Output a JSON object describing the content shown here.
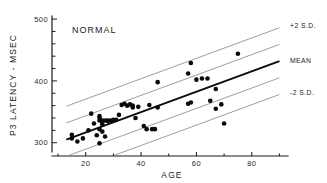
{
  "figure": {
    "panel_label": "NORMAL"
  },
  "axes": {
    "y_title": "P3 LATENCY - MSEC",
    "x_title": "AGE",
    "y_ticks_labeled": [
      "500",
      "400",
      "300"
    ],
    "y_tick_values": [
      500,
      400,
      300
    ],
    "y_minor_tick_values": [
      480,
      460,
      440,
      420,
      380,
      360,
      340,
      320
    ],
    "x_ticks_labeled": [
      "20",
      "40",
      "60",
      "80"
    ],
    "x_tick_values": [
      20,
      40,
      60,
      80
    ],
    "x_minor_tick_values": [
      10,
      30,
      50,
      70,
      90
    ]
  },
  "band_labels": {
    "upper": "+2 S.D.",
    "mean": "MEAN",
    "lower": "-2 S.D."
  },
  "colors": {
    "axis": "#1a1a1a",
    "point": "#0a0a0a",
    "mean_line": "#0d0d0d",
    "band_line": "#8c8c8c",
    "background": "#ffffff"
  },
  "chart_data": {
    "type": "scatter",
    "title": "NORMAL",
    "xlabel": "AGE",
    "ylabel": "P3 LATENCY - MSEC",
    "xlim": [
      10,
      92
    ],
    "ylim": [
      285,
      505
    ],
    "grid": false,
    "legend_position": "right-outside",
    "x": [
      15,
      15,
      17,
      19,
      21,
      22,
      23,
      24,
      25,
      25,
      25,
      25,
      25,
      26,
      26,
      26,
      26,
      27,
      27,
      28,
      28,
      29,
      30,
      31,
      32,
      33,
      34,
      35,
      36,
      37,
      37,
      38,
      39,
      41,
      42,
      43,
      44,
      45,
      46,
      46,
      57,
      57,
      58,
      58,
      60,
      62,
      64,
      65,
      67,
      67,
      69,
      70,
      75
    ],
    "y": [
      313,
      307,
      302,
      307,
      320,
      347,
      331,
      312,
      343,
      340,
      336,
      322,
      299,
      336,
      334,
      330,
      318,
      336,
      310,
      336,
      335,
      336,
      337,
      337,
      345,
      361,
      363,
      360,
      362,
      360,
      357,
      340,
      358,
      327,
      322,
      361,
      322,
      322,
      398,
      357,
      363,
      412,
      429,
      365,
      402,
      404,
      404,
      368,
      355,
      387,
      362,
      331,
      444
    ],
    "series": [
      {
        "name": "Normal subjects",
        "marker": "filled-circle",
        "count": 53
      }
    ],
    "fit_lines": [
      {
        "name": "MEAN",
        "label": "MEAN",
        "style": "solid-thick",
        "color": "#0d0d0d",
        "x0": 13,
        "y0": 305,
        "x1": 90,
        "y1": 432
      },
      {
        "name": "+2 S.D.",
        "label": "+2 S.D.",
        "style": "solid-thin",
        "color": "#8c8c8c",
        "x0": 13,
        "y0": 359,
        "x1": 90,
        "y1": 486
      },
      {
        "name": "+1 S.D.",
        "label": "",
        "style": "solid-thin",
        "color": "#8c8c8c",
        "x0": 13,
        "y0": 332,
        "x1": 90,
        "y1": 459
      },
      {
        "name": "-1 S.D.",
        "label": "",
        "style": "solid-thin",
        "color": "#8c8c8c",
        "x0": 13,
        "y0": 278,
        "x1": 90,
        "y1": 405
      },
      {
        "name": "-2 S.D.",
        "label": "-2 S.D.",
        "style": "solid-thin",
        "color": "#8c8c8c",
        "x0": 13,
        "y0": 251,
        "x1": 90,
        "y1": 378
      }
    ]
  }
}
